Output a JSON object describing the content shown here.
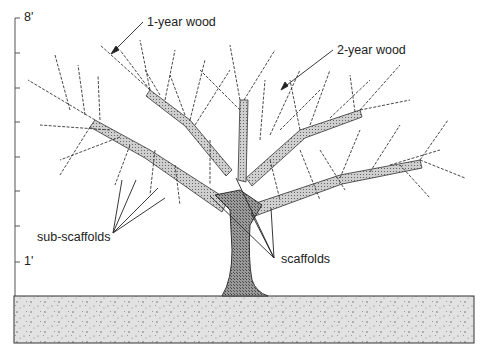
{
  "scale": {
    "top_label": "8'",
    "bottom_label": "1'",
    "ticks": 8
  },
  "labels": {
    "one_year_wood": "1-year wood",
    "two_year_wood": "2-year wood",
    "sub_scaffolds": "sub-scaffolds",
    "scaffolds": "scaffolds"
  },
  "colors": {
    "ink": "#222222",
    "trunk_fill": "#8a8a8a",
    "ground_fill": "#dcdcdc"
  }
}
